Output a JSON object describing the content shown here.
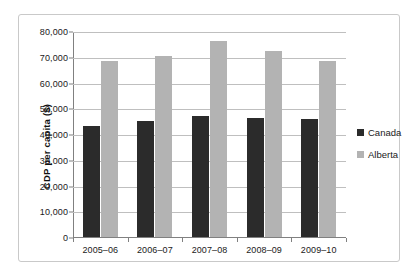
{
  "chart_data": {
    "type": "bar",
    "title": "",
    "xlabel": "",
    "ylabel": "CDP per capita ($)",
    "ylim": [
      0,
      80000
    ],
    "ytick_values": [
      0,
      10000,
      20000,
      30000,
      40000,
      50000,
      60000,
      70000,
      80000
    ],
    "ytick_labels": [
      "0",
      "10,000",
      "20,000",
      "30,000",
      "40,000",
      "50,000",
      "60,000",
      "70,000",
      "80,000"
    ],
    "categories": [
      "2005–06",
      "2006–07",
      "2007–08",
      "2008–09",
      "2009–10"
    ],
    "series": [
      {
        "name": "Canada",
        "color": "#2b2b2b",
        "values": [
          43000,
          45000,
          47000,
          46300,
          46000
        ]
      },
      {
        "name": "Alberta",
        "color": "#b3b3b3",
        "values": [
          68200,
          70400,
          76000,
          72200,
          68500
        ]
      }
    ],
    "grid": true,
    "legend_position": "right"
  },
  "legend": {
    "items": [
      {
        "label": "Canada"
      },
      {
        "label": "Alberta"
      }
    ]
  }
}
